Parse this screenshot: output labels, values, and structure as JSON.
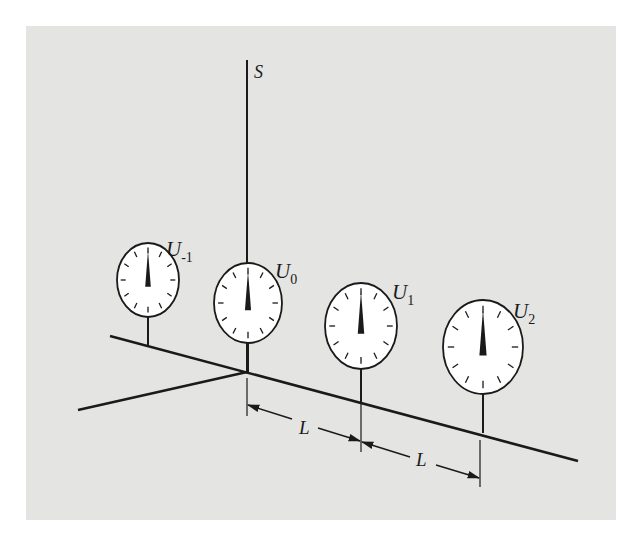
{
  "figure": {
    "background": "#ffffff",
    "panel_color": "#e4e4e2",
    "ink_color": "#1a1a1a",
    "dial_face_color": "#ffffff",
    "axis_label": "S",
    "dimension_label": "L",
    "dials": [
      {
        "name": "U",
        "subscript": "-1",
        "cx": 148,
        "cy": 280,
        "rx": 31,
        "ry": 37,
        "stem_bottom": 345,
        "label_x": 166,
        "label_y": 256
      },
      {
        "name": "U",
        "subscript": "0",
        "cx": 248,
        "cy": 303,
        "rx": 34,
        "ry": 40,
        "stem_bottom": 372,
        "label_x": 275,
        "label_y": 278
      },
      {
        "name": "U",
        "subscript": "1",
        "cx": 361,
        "cy": 326,
        "rx": 36,
        "ry": 43,
        "stem_bottom": 402,
        "label_x": 392,
        "label_y": 299
      },
      {
        "name": "U",
        "subscript": "2",
        "cx": 483,
        "cy": 347,
        "rx": 40,
        "ry": 47,
        "stem_bottom": 433,
        "label_x": 513,
        "label_y": 318
      }
    ],
    "dimensions": [
      {
        "label": "L",
        "from": "U0",
        "to": "U1"
      },
      {
        "label": "L",
        "from": "U1",
        "to": "U2"
      }
    ]
  }
}
